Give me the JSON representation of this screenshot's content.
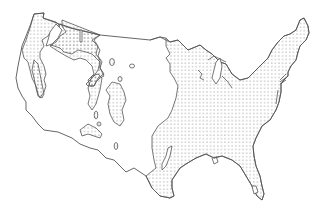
{
  "map": {
    "subject": "contiguous-united-states",
    "legend": [],
    "title": "",
    "regions": [
      {
        "name": "pacific-northwest-forest",
        "pattern": "dotted"
      },
      {
        "name": "northern-rockies-forest",
        "pattern": "dotted"
      },
      {
        "name": "sierra-nevada-forest",
        "pattern": "dotted"
      },
      {
        "name": "eastern-forest",
        "pattern": "dotted"
      },
      {
        "name": "southern-rockies-forest",
        "pattern": "dotted"
      },
      {
        "name": "black-hills-forest",
        "pattern": "dotted"
      },
      {
        "name": "great-basin-mountain-patches",
        "pattern": "dotted"
      }
    ],
    "colors": {
      "background": "#ffffff",
      "outline": "#555555",
      "dots": "#666666"
    }
  }
}
